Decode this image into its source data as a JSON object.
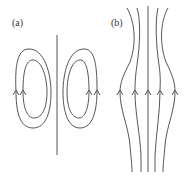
{
  "panels": [
    {
      "id": "a",
      "label": "(a)",
      "description": "Closed field-line loops on either side of a vertical line"
    },
    {
      "id": "b",
      "label": "(b)",
      "description": "Open field lines bulging outward at the middle, all directed upward"
    }
  ],
  "colors": {
    "stroke": "#555555",
    "background": "#ffffff"
  }
}
